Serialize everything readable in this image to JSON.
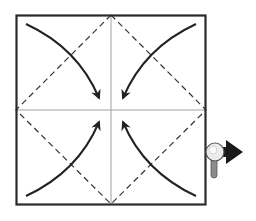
{
  "diagram": {
    "type": "origami-fold-instruction",
    "colors": {
      "outline": "#2a2a2a",
      "crease": "#9a9a9a",
      "dashed": "#333333",
      "arrow": "#222222",
      "magnifier_lens": "#e8e8e8",
      "magnifier_handle": "#8c8c8c",
      "next_arrow": "#1a1a1a"
    },
    "steps": [
      {
        "name": "fold-top-left-corner-to-center"
      },
      {
        "name": "fold-top-right-corner-to-center"
      },
      {
        "name": "fold-bottom-left-corner-to-center"
      },
      {
        "name": "fold-bottom-right-corner-to-center"
      }
    ],
    "icons": {
      "magnifier": "magnifier-icon",
      "next": "arrow-right-icon"
    }
  }
}
